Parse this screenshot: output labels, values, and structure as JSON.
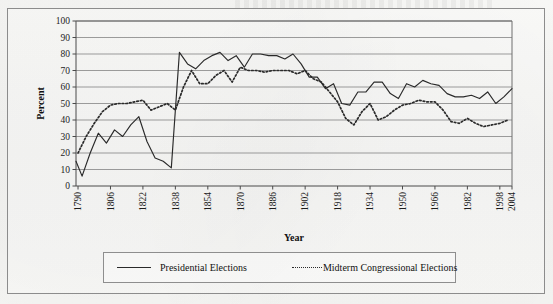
{
  "figure": {
    "frame_color": "#8c8c8c",
    "background": "#f4f4f2",
    "line_color": "#2a2a2a"
  },
  "axis_titles": {
    "x": "Year",
    "y": "Percent"
  },
  "legend": {
    "presidential_label": "Presidential Elections",
    "midterm_label": "Midterm Congressional Elections"
  },
  "chart_data": {
    "type": "line",
    "title": "",
    "xlabel": "Year",
    "ylabel": "Percent",
    "xlim": [
      1789,
      2004
    ],
    "ylim": [
      0,
      100
    ],
    "grid": "horizontal",
    "legend_position": "bottom",
    "y_ticks": [
      0,
      10,
      20,
      30,
      40,
      50,
      60,
      70,
      80,
      90,
      100
    ],
    "x_ticks": [
      1790,
      1806,
      1822,
      1838,
      1854,
      1870,
      1886,
      1902,
      1918,
      1934,
      1950,
      1966,
      1982,
      1998,
      2004
    ],
    "series": [
      {
        "name": "Presidential Elections",
        "style": "solid",
        "x": [
          1789,
          1792,
          1796,
          1800,
          1804,
          1808,
          1812,
          1816,
          1820,
          1824,
          1828,
          1832,
          1836,
          1840,
          1844,
          1848,
          1852,
          1856,
          1860,
          1864,
          1868,
          1872,
          1876,
          1880,
          1884,
          1888,
          1892,
          1896,
          1900,
          1904,
          1908,
          1912,
          1916,
          1920,
          1924,
          1928,
          1932,
          1936,
          1940,
          1944,
          1948,
          1952,
          1956,
          1960,
          1964,
          1968,
          1972,
          1976,
          1980,
          1984,
          1988,
          1992,
          1996,
          2000,
          2004
        ],
        "values": [
          15,
          6,
          20,
          32,
          26,
          34,
          30,
          37,
          42,
          27,
          17,
          15,
          11,
          81,
          74,
          71,
          76,
          79,
          81,
          76,
          79,
          72,
          80,
          80,
          79,
          79,
          77,
          80,
          74,
          66,
          66,
          59,
          62,
          50,
          49,
          57,
          57,
          63,
          63,
          56,
          53,
          62,
          60,
          64,
          62,
          61,
          56,
          54,
          54,
          55,
          53,
          57,
          50,
          54,
          59
        ]
      },
      {
        "name": "Midterm Congressional Elections",
        "style": "dotted",
        "x": [
          1790,
          1794,
          1798,
          1802,
          1806,
          1810,
          1814,
          1818,
          1822,
          1826,
          1830,
          1834,
          1838,
          1842,
          1846,
          1850,
          1854,
          1858,
          1862,
          1866,
          1870,
          1874,
          1878,
          1882,
          1886,
          1890,
          1894,
          1898,
          1902,
          1906,
          1910,
          1914,
          1918,
          1922,
          1926,
          1930,
          1934,
          1938,
          1942,
          1946,
          1950,
          1954,
          1958,
          1962,
          1966,
          1970,
          1974,
          1978,
          1982,
          1986,
          1990,
          1994,
          1998,
          2002
        ],
        "values": [
          20,
          30,
          38,
          45,
          49,
          50,
          50,
          51,
          52,
          46,
          48,
          50,
          46,
          60,
          70,
          62,
          62,
          67,
          70,
          63,
          72,
          70,
          70,
          69,
          70,
          70,
          70,
          68,
          70,
          65,
          63,
          57,
          51,
          41,
          37,
          45,
          50,
          40,
          42,
          46,
          49,
          50,
          52,
          51,
          51,
          46,
          39,
          38,
          41,
          38,
          36,
          37,
          38,
          40
        ]
      }
    ]
  }
}
